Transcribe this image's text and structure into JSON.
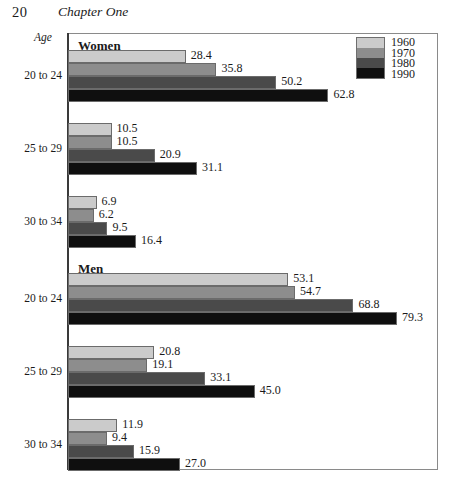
{
  "page": {
    "number": "20",
    "chapter": "Chapter One"
  },
  "axis_corner_label": "Age",
  "legend": {
    "entries": [
      {
        "label": "1960",
        "color": "#cbcbcb"
      },
      {
        "label": "1970",
        "color": "#8d8d8d"
      },
      {
        "label": "1980",
        "color": "#4a4a4a"
      },
      {
        "label": "1990",
        "color": "#0f0f0f"
      }
    ]
  },
  "panels": [
    {
      "title": "Women"
    },
    {
      "title": "Men"
    }
  ],
  "categories": [
    "20 to 24",
    "25 to 29",
    "30 to 34"
  ],
  "chart_data": {
    "type": "bar",
    "orientation": "horizontal",
    "title": "",
    "subtitle": "",
    "xlabel": "",
    "ylabel": "Age",
    "grid": false,
    "legend_position": "top-right",
    "xlim": [
      0,
      89
    ],
    "categories": [
      "20 to 24",
      "25 to 29",
      "30 to 34"
    ],
    "panels": [
      {
        "name": "Women",
        "series": [
          {
            "name": "1960",
            "values": [
              28.4,
              10.5,
              6.9
            ]
          },
          {
            "name": "1970",
            "values": [
              35.8,
              10.5,
              6.2
            ]
          },
          {
            "name": "1980",
            "values": [
              50.2,
              20.9,
              9.5
            ]
          },
          {
            "name": "1990",
            "values": [
              62.8,
              31.1,
              16.4
            ]
          }
        ]
      },
      {
        "name": "Men",
        "series": [
          {
            "name": "1960",
            "values": [
              53.1,
              20.8,
              11.9
            ]
          },
          {
            "name": "1970",
            "values": [
              54.7,
              19.1,
              9.4
            ]
          },
          {
            "name": "1980",
            "values": [
              68.8,
              33.1,
              15.9
            ]
          },
          {
            "name": "1990",
            "values": [
              79.3,
              45.0,
              27.0
            ]
          }
        ]
      }
    ],
    "value_labels": {
      "women": {
        "20 to 24": [
          "28.4",
          "35.8",
          "50.2",
          "62.8"
        ],
        "25 to 29": [
          "10.5",
          "10.5",
          "20.9",
          "31.1"
        ],
        "30 to 34": [
          "6.9",
          "6.2",
          "9.5",
          "16.4"
        ]
      },
      "men": {
        "20 to 24": [
          "53.1",
          "54.7",
          "68.8",
          "79.3"
        ],
        "25 to 29": [
          "20.8",
          "19.1",
          "33.1",
          "45.0"
        ],
        "30 to 34": [
          "11.9",
          "9.4",
          "15.9",
          "27.0"
        ]
      }
    }
  },
  "layout": {
    "px_per_unit": 4.148,
    "bar_height": 13,
    "group_tops": [
      50,
      123,
      196,
      273,
      346,
      419
    ]
  }
}
